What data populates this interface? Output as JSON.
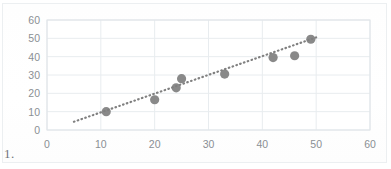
{
  "figure": {
    "item_number": "1.",
    "colors": {
      "marker": "#7f7f7f",
      "trendline": "#808080",
      "gridline": "#e8ecef",
      "plot_border": "#dfe4e8",
      "tick_text": "#8a8f94",
      "background": "#ffffff"
    }
  },
  "chart_data": {
    "type": "scatter",
    "title": "",
    "xlabel": "",
    "ylabel": "",
    "xlim": [
      0,
      60
    ],
    "ylim": [
      0,
      60
    ],
    "xticks": [
      0,
      10,
      20,
      30,
      40,
      50,
      60
    ],
    "yticks": [
      0,
      10,
      20,
      30,
      40,
      50,
      60
    ],
    "xtick_labels": [
      "0",
      "10",
      "20",
      "30",
      "40",
      "50",
      "60"
    ],
    "ytick_labels": [
      "0",
      "10",
      "20",
      "30",
      "40",
      "50",
      "60"
    ],
    "grid": "horizontal-and-vertical",
    "legend": "none",
    "series": [
      {
        "name": "data",
        "marker": "circle",
        "points": [
          {
            "x": 11,
            "y": 10
          },
          {
            "x": 20,
            "y": 16.5
          },
          {
            "x": 24,
            "y": 23
          },
          {
            "x": 25,
            "y": 28
          },
          {
            "x": 33,
            "y": 30.5
          },
          {
            "x": 42,
            "y": 39.5
          },
          {
            "x": 46,
            "y": 40.5
          },
          {
            "x": 49,
            "y": 49.5
          }
        ]
      },
      {
        "name": "trendline",
        "type": "linear-fit",
        "style": "dotted",
        "x_start": 5,
        "y_start": 4.5,
        "x_end": 50,
        "y_end": 50.5
      }
    ]
  }
}
